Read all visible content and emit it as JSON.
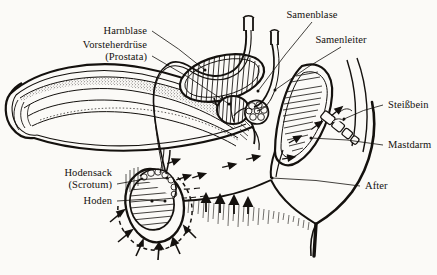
{
  "figure": {
    "background_color": "#fbfaf7",
    "ink_color": "#14110e",
    "language": "de",
    "style": "engraving / line drawing"
  },
  "labels": [
    {
      "id": "harnblase",
      "text": "Harnblase",
      "text2": "",
      "side": "right",
      "x": 147,
      "y": 31,
      "tip_x": 205,
      "tip_y": 70
    },
    {
      "id": "vorsteherdruese",
      "text": "Vorsteherdrüse",
      "text2": "(Prostata)",
      "side": "right",
      "x": 147,
      "y": 50,
      "tip_x": 229,
      "tip_y": 104
    },
    {
      "id": "samenblase",
      "text": "Samenblase",
      "text2": "",
      "side": "center",
      "x": 312,
      "y": 15,
      "tip_x": 258,
      "tip_y": 91
    },
    {
      "id": "samenleiter",
      "text": "Samenleiter",
      "text2": "",
      "side": "center",
      "x": 341,
      "y": 40,
      "tip_x": 275,
      "tip_y": 90
    },
    {
      "id": "steissbein",
      "text": "Steißbein",
      "text2": "",
      "side": "left",
      "x": 388,
      "y": 105,
      "tip_x": 344,
      "tip_y": 119
    },
    {
      "id": "mastdarm",
      "text": "Mastdarm",
      "text2": "",
      "side": "left",
      "x": 388,
      "y": 145,
      "tip_x": 311,
      "tip_y": 138
    },
    {
      "id": "after",
      "text": "After",
      "text2": "",
      "side": "left",
      "x": 365,
      "y": 186,
      "tip_x": 272,
      "tip_y": 178
    },
    {
      "id": "hodensack",
      "text": "Hodensack",
      "text2": "(Scrotum)",
      "side": "right",
      "x": 112,
      "y": 178,
      "tip_x": 167,
      "tip_y": 178
    },
    {
      "id": "hoden",
      "text": "Hoden",
      "text2": "",
      "side": "right",
      "x": 112,
      "y": 201,
      "tip_x": 165,
      "tip_y": 201
    }
  ],
  "structures": [
    {
      "id": "penis-shaft",
      "name": "Penisschaft mit Schwellkörpern"
    },
    {
      "id": "urinary-bladder",
      "name": "Harnblase"
    },
    {
      "id": "prostate",
      "name": "Prostata"
    },
    {
      "id": "seminal-vesicle",
      "name": "Samenblase"
    },
    {
      "id": "vas-deferens",
      "name": "Samenleiter"
    },
    {
      "id": "rectum",
      "name": "Mastdarm"
    },
    {
      "id": "coccyx",
      "name": "Steißbein"
    },
    {
      "id": "anus",
      "name": "After"
    },
    {
      "id": "testicle",
      "name": "Hoden"
    },
    {
      "id": "scrotum",
      "name": "Hodensack"
    },
    {
      "id": "body-contour",
      "name": "Körperkontur / Gesäß"
    }
  ]
}
